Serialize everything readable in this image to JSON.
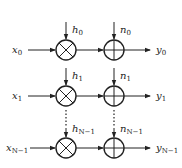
{
  "diagram": {
    "title": "",
    "rows": [
      {
        "input": "x",
        "input_sub": "0",
        "gain": "h",
        "gain_sub": "0",
        "noise": "n",
        "noise_sub": "0",
        "output": "y",
        "output_sub": "0"
      },
      {
        "input": "x",
        "input_sub": "1",
        "gain": "h",
        "gain_sub": "1",
        "noise": "n",
        "noise_sub": "1",
        "output": "y",
        "output_sub": "1"
      },
      {
        "input": "x",
        "input_sub": "N−1",
        "gain": "h",
        "gain_sub": "N−1",
        "noise": "n",
        "noise_sub": "N−1",
        "output": "y",
        "output_sub": "N−1"
      }
    ],
    "nodes": {
      "multiplier": "multiplier-circle (⊗)",
      "adder": "adder-circle (⊕)"
    },
    "ellipsis": "⋮"
  }
}
